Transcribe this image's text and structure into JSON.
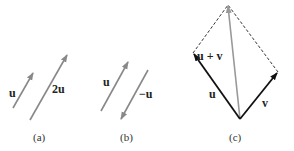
{
  "figure": {
    "panels": [
      {
        "caption": "(a)",
        "vectors": [
          {
            "label": "u",
            "from": [
              13,
              108
            ],
            "to": [
              33,
              73
            ],
            "color": "#888888"
          },
          {
            "label": "2u",
            "from": [
              30,
              120
            ],
            "to": [
              67,
              55
            ],
            "color": "#888888"
          }
        ]
      },
      {
        "caption": "(b)",
        "vectors": [
          {
            "label": "u",
            "from": [
              101,
              111
            ],
            "to": [
              128,
              62
            ],
            "color": "#888888"
          },
          {
            "label": "−u",
            "from": [
              148,
              70
            ],
            "to": [
              121,
              119
            ],
            "color": "#888888"
          }
        ]
      },
      {
        "caption": "(c)",
        "vectors": [
          {
            "label": "u",
            "from": [
              240,
              119
            ],
            "to": [
              193,
              53
            ],
            "color": "#111111"
          },
          {
            "label": "v",
            "from": [
              240,
              119
            ],
            "to": [
              278,
              72
            ],
            "color": "#111111"
          },
          {
            "label": "u + v",
            "from": [
              240,
              119
            ],
            "to": [
              228,
              5
            ],
            "color": "#999999"
          }
        ],
        "dashed_edges": [
          {
            "from": [
              193,
              53
            ],
            "to": [
              228,
              5
            ]
          },
          {
            "from": [
              278,
              72
            ],
            "to": [
              228,
              5
            ]
          }
        ]
      }
    ]
  }
}
